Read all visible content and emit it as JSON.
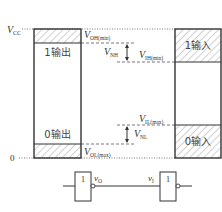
{
  "diagram": {
    "rails": {
      "vcc_label": "V",
      "vcc_sub": "CC",
      "zero_label": "0"
    },
    "output_block": {
      "high_label": "1输出",
      "low_label": "0输出"
    },
    "input_block": {
      "high_label": "1输入",
      "low_label": "0输入"
    },
    "thresholds": {
      "voh_main": "V",
      "voh_sub": "OH(min)",
      "vih_main": "V",
      "vih_sub": "IH(min)",
      "vil_main": "V",
      "vil_sub": "IL(max)",
      "vol_main": "V",
      "vol_sub": "OL(max)"
    },
    "margins": {
      "vnh_main": "V",
      "vnh_sub": "NH",
      "vnl_main": "V",
      "vnl_sub": "NL"
    },
    "gates": {
      "driver_symbol": "1",
      "driver_output_label_main": "v",
      "driver_output_label_sub": "O",
      "load_symbol": "1",
      "load_input_label_main": "v",
      "load_input_label_sub": "I"
    },
    "colors": {
      "line": "#333333",
      "hatch": "#888888",
      "background": "#ffffff"
    }
  }
}
